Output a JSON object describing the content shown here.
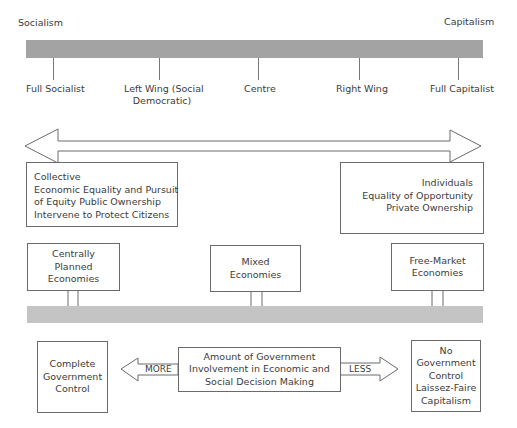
{
  "spectrum": {
    "left_pole": "Socialism",
    "right_pole": "Capitalism",
    "positions": [
      {
        "label_line1": "Full Socialist",
        "label_line2": ""
      },
      {
        "label_line1": "Left Wing (Social",
        "label_line2": "Democratic)"
      },
      {
        "label_line1": "Centre",
        "label_line2": ""
      },
      {
        "label_line1": "Right Wing",
        "label_line2": ""
      },
      {
        "label_line1": "Full Capitalist",
        "label_line2": ""
      }
    ]
  },
  "values": {
    "left": {
      "lines": [
        "Collective",
        "Economic Equality and Pursuit",
        "of Equity Public Ownership",
        "Intervene to Protect Citizens"
      ]
    },
    "right": {
      "lines": [
        "Individuals",
        "Equality of Opportunity",
        "Private Ownership"
      ]
    }
  },
  "economies": [
    {
      "lines": [
        "Centrally",
        "Planned",
        "Economies"
      ]
    },
    {
      "lines": [
        "Mixed",
        "Economies"
      ]
    },
    {
      "lines": [
        "Free-Market",
        "Economies"
      ]
    }
  ],
  "government": {
    "left_box": {
      "lines": [
        "Complete",
        "Government",
        "Control"
      ]
    },
    "center_box": {
      "lines": [
        "Amount of Government",
        "Involvement in Economic and",
        "Social Decision Making"
      ]
    },
    "right_box": {
      "lines": [
        "No",
        "Government",
        "Control",
        "Laissez-Faire",
        "Capitalism"
      ]
    },
    "more_label": "MORE",
    "less_label": "LESS"
  },
  "colors": {
    "top_bar": "#a3a3a3",
    "bottom_bar": "#c4c4c4",
    "stroke": "#6a6a6a",
    "text": "#3c3c3c"
  }
}
